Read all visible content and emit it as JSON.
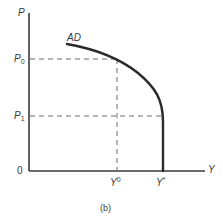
{
  "diagram": {
    "type": "economics-aggregate-demand",
    "caption": "(b)",
    "axes": {
      "y_label": "P",
      "x_label": "Y",
      "origin_label": "0"
    },
    "curve": {
      "label": "AD",
      "description": "Aggregate demand curve that slopes downward and becomes vertical at Y*"
    },
    "price_levels": [
      {
        "label": "P",
        "subscript": "0"
      },
      {
        "label": "P",
        "subscript": "1"
      }
    ],
    "output_levels": [
      {
        "label": "Y",
        "superscript": "0"
      },
      {
        "label": "Y",
        "superscript": "*"
      }
    ],
    "colors": {
      "axis": "#3a3a3a",
      "curve": "#2a2a2a",
      "dashed": "#6a6a6a",
      "text": "#3a3a3a"
    }
  }
}
